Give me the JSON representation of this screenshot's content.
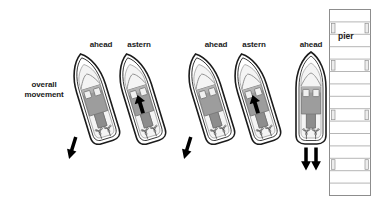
{
  "figure": {
    "title_visible": false,
    "background_color": "#ffffff",
    "width": 377,
    "height": 204
  },
  "palette": {
    "outline": "#1b1b1b",
    "hull_fill": "#ffffff",
    "deck_fill": "#f2f2f2",
    "cabin_fill": "#9a9a9a",
    "cabin_fill_light": "#c9c9c9",
    "window_fill": "#efefef",
    "arrow_fill": "#000000",
    "pier_line": "#8d8d8d",
    "pier_fill": "#ffffff",
    "piling_fill": "#e6e6e6",
    "text": "#1b1b1b"
  },
  "annotations": {
    "overall_movement": {
      "line1": "overall",
      "line2": "movement"
    },
    "pier": "pier"
  },
  "boats": [
    {
      "id": "boat-1",
      "engine_label": "ahead",
      "rotation_deg": -17,
      "label_x": 101,
      "label_y": 40,
      "thrust": "ahead",
      "has_internal_arrow": false,
      "has_external_arrow": true,
      "external_arrow_direction": "down-left"
    },
    {
      "id": "boat-2",
      "engine_label": "astern",
      "rotation_deg": -17,
      "label_x": 139,
      "label_y": 40,
      "thrust": "astern",
      "has_internal_arrow": true,
      "internal_arrow_direction": "up",
      "has_external_arrow": false
    },
    {
      "id": "boat-3",
      "engine_label": "ahead",
      "rotation_deg": -17,
      "label_x": 216,
      "label_y": 40,
      "thrust": "ahead",
      "has_internal_arrow": false,
      "has_external_arrow": true,
      "external_arrow_direction": "down-left"
    },
    {
      "id": "boat-4",
      "engine_label": "astern",
      "rotation_deg": -17,
      "label_x": 254,
      "label_y": 40,
      "thrust": "astern",
      "has_internal_arrow": true,
      "internal_arrow_direction": "up",
      "has_external_arrow": false
    },
    {
      "id": "boat-5",
      "engine_label": "ahead",
      "rotation_deg": 0,
      "label_x": 311,
      "label_y": 40,
      "thrust": "ahead",
      "has_internal_arrow": false,
      "has_external_arrow": true,
      "external_arrow_direction": "down-double"
    }
  ],
  "pier": {
    "x": 329,
    "y": 9,
    "width": 42,
    "height": 187,
    "plank_count": 15,
    "piling_rows": [
      1,
      4,
      8,
      12
    ]
  }
}
